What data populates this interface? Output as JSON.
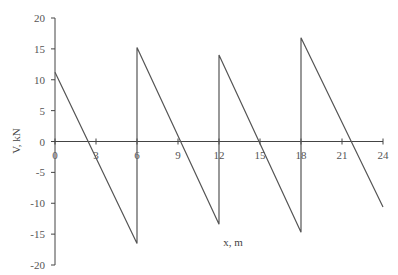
{
  "chart_data": {
    "type": "line",
    "title": "",
    "xlabel": "x, m",
    "ylabel": "V, kN",
    "xlim": [
      0,
      24
    ],
    "ylim": [
      -20,
      20
    ],
    "x_ticks": [
      0,
      3,
      6,
      9,
      12,
      15,
      18,
      21,
      24
    ],
    "y_ticks": [
      20,
      15,
      10,
      5,
      0,
      -5,
      -10,
      -15,
      -20
    ],
    "grid": false,
    "legend": null,
    "series": [
      {
        "name": "Shear force V",
        "color": "#555555",
        "points": [
          {
            "x": 0,
            "y": 11.2
          },
          {
            "x": 6,
            "y": -16.5
          },
          {
            "x": 6,
            "y": 15.2
          },
          {
            "x": 12,
            "y": -13.4
          },
          {
            "x": 12,
            "y": 14.0
          },
          {
            "x": 18,
            "y": -14.7
          },
          {
            "x": 18,
            "y": 16.8
          },
          {
            "x": 24,
            "y": -10.6
          }
        ]
      }
    ]
  }
}
